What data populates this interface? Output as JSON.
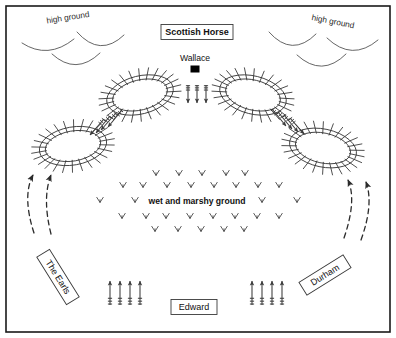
{
  "diagram": {
    "background_color": "#ffffff",
    "border_color": "#1a1a1a",
    "width": 396,
    "height": 338
  },
  "terrain_labels": [
    {
      "id": "high-ground-left",
      "text": "high ground",
      "x": 68,
      "y": 18,
      "rotation": -9
    },
    {
      "id": "high-ground-right",
      "text": "high ground",
      "x": 333,
      "y": 22,
      "rotation": 11
    }
  ],
  "marsh": {
    "label": "wet and marshy ground",
    "label_x": 197,
    "label_y": 202,
    "tuft_rows": [
      {
        "y": 173,
        "xs": [
          156,
          179,
          202,
          226,
          245
        ]
      },
      {
        "y": 185,
        "xs": [
          123,
          143,
          167,
          191,
          214,
          236,
          258,
          279
        ]
      },
      {
        "y": 200,
        "xs": [
          100,
          135,
          262,
          297
        ]
      },
      {
        "y": 216,
        "xs": [
          122,
          146,
          166,
          190,
          213,
          235,
          257,
          279
        ]
      },
      {
        "y": 229,
        "xs": [
          155,
          178,
          201,
          224,
          244
        ]
      }
    ]
  },
  "boxed_labels": [
    {
      "id": "scottish-horse",
      "text": "Scottish Horse",
      "x": 197,
      "y": 32,
      "w": 72,
      "h": 15,
      "rotation": 0,
      "bold": true
    },
    {
      "id": "edward",
      "text": "Edward",
      "x": 194,
      "y": 307,
      "w": 46,
      "h": 15,
      "rotation": 0,
      "bold": false
    },
    {
      "id": "the-earls",
      "text": "The Earls",
      "x": 58,
      "y": 277,
      "w": 56,
      "h": 15,
      "rotation": 58,
      "bold": false
    },
    {
      "id": "durham",
      "text": "Durham",
      "x": 325,
      "y": 275,
      "w": 52,
      "h": 15,
      "rotation": -32,
      "bold": false
    }
  ],
  "commanders": [
    {
      "id": "wallace",
      "name": "Wallace",
      "label_x": 195,
      "label_y": 59,
      "marker_x": 195,
      "marker_y": 69,
      "marker_w": 9,
      "marker_h": 7
    }
  ],
  "schiltrons": [
    {
      "id": "schiltron-top-left",
      "cx": 140,
      "cy": 95,
      "rx": 34,
      "ry": 19,
      "rotation": -14,
      "pike_count": 26
    },
    {
      "id": "schiltron-top-right",
      "cx": 253,
      "cy": 95,
      "rx": 34,
      "ry": 19,
      "rotation": 14,
      "pike_count": 26
    },
    {
      "id": "schiltron-bottom-left",
      "cx": 73,
      "cy": 146,
      "rx": 34,
      "ry": 19,
      "rotation": -10,
      "pike_count": 26
    },
    {
      "id": "schiltron-bottom-right",
      "cx": 323,
      "cy": 148,
      "rx": 34,
      "ry": 19,
      "rotation": 12,
      "pike_count": 26
    }
  ],
  "contours": [
    {
      "id": "contour-left-1",
      "d": "M 22 43 Q 48 60 74 39"
    },
    {
      "id": "contour-left-2",
      "d": "M 77 32 Q 100 58 124 35"
    },
    {
      "id": "contour-left-3",
      "d": "M 52 54 Q 76 76 100 53"
    },
    {
      "id": "contour-right-1",
      "d": "M 269 32 Q 292 58 316 34"
    },
    {
      "id": "contour-right-2",
      "d": "M 327 38 Q 352 62 378 40"
    },
    {
      "id": "contour-right-3",
      "d": "M 297 55 Q 322 78 346 54"
    }
  ],
  "arrow_groups": [
    {
      "id": "scottish-horse-retreat",
      "description": "downward arrows below Wallace",
      "direction": "down",
      "count": 3,
      "arrows": [
        {
          "x1": 188,
          "y1": 85,
          "x2": 188,
          "y2": 103
        },
        {
          "x1": 197,
          "y1": 85,
          "x2": 197,
          "y2": 103
        },
        {
          "x1": 206,
          "y1": 85,
          "x2": 206,
          "y2": 103
        }
      ]
    },
    {
      "id": "scots-left-diagonal",
      "description": "diagonal arrows down-left between schiltrons",
      "direction": "down-left",
      "count": 4,
      "arrows": [
        {
          "x1": 116,
          "y1": 113,
          "x2": 101,
          "y2": 130
        },
        {
          "x1": 110,
          "y1": 116,
          "x2": 96,
          "y2": 133
        },
        {
          "x1": 104,
          "y1": 119,
          "x2": 90,
          "y2": 135
        },
        {
          "x1": 122,
          "y1": 110,
          "x2": 108,
          "y2": 127
        }
      ]
    },
    {
      "id": "scots-right-diagonal",
      "description": "diagonal arrows down-right between schiltrons",
      "direction": "down-right",
      "count": 4,
      "arrows": [
        {
          "x1": 278,
          "y1": 112,
          "x2": 292,
          "y2": 129
        },
        {
          "x1": 284,
          "y1": 115,
          "x2": 298,
          "y2": 132
        },
        {
          "x1": 290,
          "y1": 118,
          "x2": 304,
          "y2": 134
        },
        {
          "x1": 272,
          "y1": 109,
          "x2": 286,
          "y2": 126
        }
      ]
    },
    {
      "id": "english-left-advance",
      "description": "English troops advancing north, left of Edward",
      "direction": "up",
      "count": 4,
      "arrows": [
        {
          "x1": 110,
          "y1": 305,
          "x2": 110,
          "y2": 281
        },
        {
          "x1": 120,
          "y1": 305,
          "x2": 120,
          "y2": 281
        },
        {
          "x1": 130,
          "y1": 305,
          "x2": 130,
          "y2": 281
        },
        {
          "x1": 140,
          "y1": 305,
          "x2": 140,
          "y2": 281
        }
      ]
    },
    {
      "id": "english-right-advance",
      "description": "English troops advancing north, right of Edward",
      "direction": "up",
      "count": 4,
      "arrows": [
        {
          "x1": 252,
          "y1": 305,
          "x2": 252,
          "y2": 281
        },
        {
          "x1": 262,
          "y1": 305,
          "x2": 262,
          "y2": 281
        },
        {
          "x1": 272,
          "y1": 305,
          "x2": 272,
          "y2": 281
        },
        {
          "x1": 282,
          "y1": 305,
          "x2": 282,
          "y2": 281
        }
      ]
    }
  ],
  "flanking_moves": [
    {
      "id": "earls-flank-outer",
      "d": "M 34 233 Q 22 196 33 175",
      "arrow_x": 33,
      "arrow_y": 173,
      "arrow_angle": -55
    },
    {
      "id": "earls-flank-inner",
      "d": "M 51 234 Q 42 198 51 175",
      "arrow_x": 51,
      "arrow_y": 173,
      "arrow_angle": -52
    },
    {
      "id": "durham-flank-inner",
      "d": "M 344 238 Q 357 200 348 180",
      "arrow_x": 348,
      "arrow_y": 178,
      "arrow_angle": 232
    },
    {
      "id": "durham-flank-outer",
      "d": "M 361 240 Q 374 204 366 182",
      "arrow_x": 366,
      "arrow_y": 180,
      "arrow_angle": 235
    }
  ]
}
